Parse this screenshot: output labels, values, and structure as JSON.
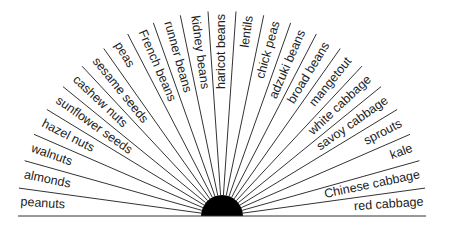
{
  "diagram": {
    "type": "radial-fan",
    "center": {
      "x": 222,
      "y": 216
    },
    "hub_radius": 21,
    "spoke_length": 205,
    "colors": {
      "line": "#333333",
      "hub": "#000000",
      "text": "#222222",
      "background": "#ffffff"
    },
    "labels": [
      "peanuts",
      "almonds",
      "walnuts",
      "hazel nuts",
      "sunflower seeds",
      "cashew nuts",
      "sesame seeds",
      "peas",
      "French beans",
      "runner beans",
      "kidney beans",
      "haricot beans",
      "lentils",
      "chick peas",
      "adzuki beans",
      "broad beans",
      "mangetout",
      "white cabbage",
      "savoy cabbage",
      "sprouts",
      "kale",
      "Chinese cabbage",
      "red cabbage"
    ]
  }
}
